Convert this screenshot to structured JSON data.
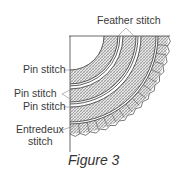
{
  "figure": {
    "caption": "Figure 3",
    "labels": {
      "feather_stitch": "Feather stitch",
      "pin_stitch_1": "Pin stitch",
      "pin_stitch_2": "Pin stitch",
      "pin_stitch_3": "Pin stitch",
      "entredeux_line1": "Entredeux",
      "entredeux_line2": "stitch"
    },
    "colors": {
      "ink": "#333333",
      "hatch": "#777777",
      "background": "#ffffff"
    }
  }
}
